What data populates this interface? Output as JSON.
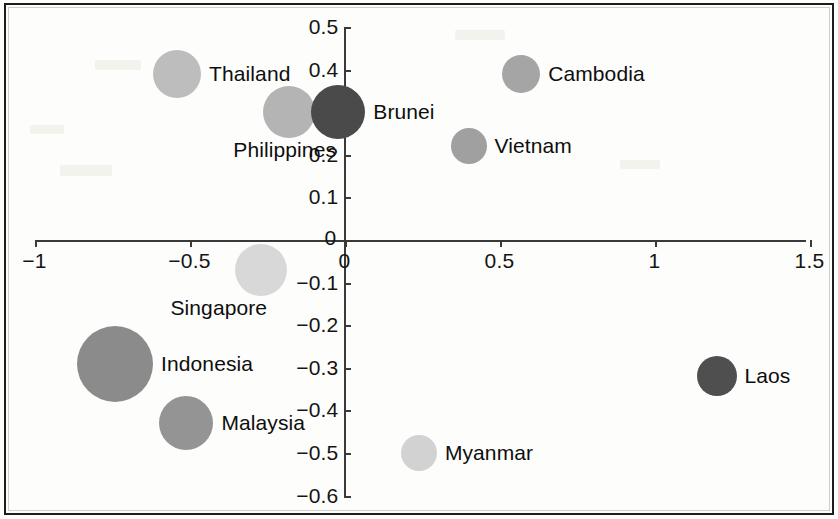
{
  "chart_data": {
    "type": "scatter",
    "title": "",
    "subtitle": "",
    "xlabel": "",
    "ylabel": "",
    "xlim": [
      -1,
      1.5
    ],
    "ylim": [
      -0.6,
      0.5
    ],
    "grid": false,
    "legend": "none",
    "x_ticks": [
      "-1",
      "-0.5",
      "0",
      "0.5",
      "1",
      "1.5"
    ],
    "x_tick_values": [
      -1,
      -0.5,
      0,
      0.5,
      1,
      1.5
    ],
    "y_ticks": [
      "0.5",
      "0.4",
      "0.3",
      "0.2",
      "0.1",
      "0",
      "-0.1",
      "-0.2",
      "-0.3",
      "-0.4",
      "-0.5",
      "-0.6"
    ],
    "y_tick_values": [
      0.5,
      0.4,
      0.3,
      0.2,
      0.1,
      0,
      -0.1,
      -0.2,
      -0.3,
      -0.4,
      -0.5,
      -0.6
    ],
    "points": [
      {
        "label": "Thailand",
        "x": -0.54,
        "y": 0.39,
        "size": 48,
        "color": "#bdbdbd",
        "label_side": "right"
      },
      {
        "label": "Philippines",
        "x": -0.18,
        "y": 0.3,
        "size": 52,
        "color": "#b4b4b4",
        "label_side": "below"
      },
      {
        "label": "Brunei",
        "x": -0.02,
        "y": 0.3,
        "size": 54,
        "color": "#4a4a4a",
        "label_side": "right"
      },
      {
        "label": "Cambodia",
        "x": 0.57,
        "y": 0.39,
        "size": 38,
        "color": "#a5a5a5",
        "label_side": "right"
      },
      {
        "label": "Vietnam",
        "x": 0.4,
        "y": 0.22,
        "size": 36,
        "color": "#a0a0a0",
        "label_side": "right"
      },
      {
        "label": "Singapore",
        "x": -0.27,
        "y": -0.07,
        "size": 52,
        "color": "#d8d8d8",
        "label_side": "belowleft"
      },
      {
        "label": "Indonesia",
        "x": -0.74,
        "y": -0.29,
        "size": 76,
        "color": "#8b8b8b",
        "label_side": "right"
      },
      {
        "label": "Malaysia",
        "x": -0.51,
        "y": -0.43,
        "size": 54,
        "color": "#949494",
        "label_side": "right"
      },
      {
        "label": "Myanmar",
        "x": 0.24,
        "y": -0.5,
        "size": 36,
        "color": "#d2d2d2",
        "label_side": "right"
      },
      {
        "label": "Laos",
        "x": 1.2,
        "y": -0.32,
        "size": 40,
        "color": "#4f4f4f",
        "label_side": "right"
      }
    ]
  },
  "axes": {
    "origin_label_x": "0",
    "origin_label_y": "0"
  },
  "colors": {
    "axis": "#3a3a3a",
    "text": "#0e0e0e",
    "frame": "#1c1c1c",
    "background": "#fdfdfc"
  }
}
